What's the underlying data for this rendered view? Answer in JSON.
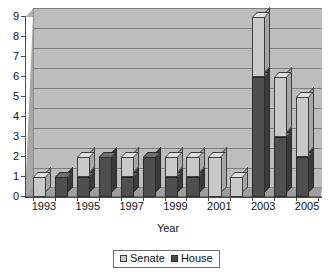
{
  "chart_data": {
    "type": "bar",
    "subtype": "stacked-column-3d",
    "title": "",
    "xlabel": "Year",
    "ylabel": "",
    "ylim": [
      0,
      9
    ],
    "y_ticks": [
      0,
      1,
      2,
      3,
      4,
      5,
      6,
      7,
      8,
      9
    ],
    "grid": true,
    "legend_position": "bottom",
    "categories": [
      "1993",
      "1994",
      "1995",
      "1996",
      "1997",
      "1998",
      "1999",
      "2000",
      "2001",
      "2002",
      "2003",
      "2004",
      "2005"
    ],
    "x_tick_labels_shown": [
      "1993",
      "1995",
      "1997",
      "1999",
      "2001",
      "2003",
      "2005"
    ],
    "series": [
      {
        "name": "Senate",
        "color": "#c9c9c9",
        "values": [
          1,
          0,
          1,
          0,
          1,
          0,
          1,
          1,
          2,
          1,
          3,
          3,
          3
        ]
      },
      {
        "name": "House",
        "color": "#4f4f4f",
        "values": [
          0,
          1,
          1,
          2,
          1,
          2,
          1,
          1,
          0,
          0,
          6,
          3,
          2
        ]
      }
    ],
    "totals": [
      1,
      1,
      2,
      2,
      2,
      2,
      2,
      2,
      2,
      1,
      9,
      6,
      5
    ]
  },
  "axes": {
    "y_labels": [
      "9",
      "8",
      "7",
      "6",
      "5",
      "4",
      "3",
      "2",
      "1",
      "0"
    ],
    "x_labels": [
      "1993",
      "1995",
      "1997",
      "1999",
      "2001",
      "2003",
      "2005"
    ],
    "x_title": "Year"
  },
  "legend": {
    "items": [
      {
        "label": "Senate",
        "swatch": "senate-swatch"
      },
      {
        "label": "House",
        "swatch": "house-swatch"
      }
    ]
  }
}
